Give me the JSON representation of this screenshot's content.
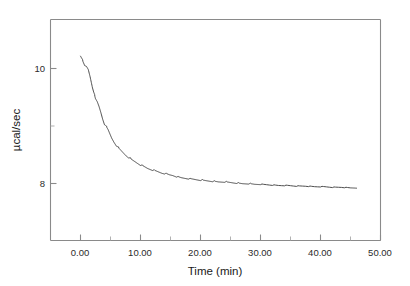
{
  "chart_data": {
    "type": "line",
    "title": "",
    "xlabel": "Time (min)",
    "ylabel": "µcal/sec",
    "xlim": [
      -5.0,
      50.0
    ],
    "ylim": [
      7.05,
      10.85
    ],
    "grid": false,
    "legend": null,
    "x_ticks": [
      0.0,
      10.0,
      20.0,
      30.0,
      40.0,
      50.0
    ],
    "x_tick_labels": [
      "0.00",
      "10.00",
      "20.00",
      "30.00",
      "40.00",
      "50.00"
    ],
    "x_minor_ticks": [
      5.0,
      15.0,
      25.0,
      35.0,
      45.0
    ],
    "y_ticks": [
      8.0,
      10.0
    ],
    "y_tick_labels": [
      "8",
      "10"
    ],
    "y_minor_ticks": [
      9.0
    ],
    "series": [
      {
        "name": "ITC raw thermogram",
        "color": "#3a3a3a",
        "x": [
          0.0,
          0.35,
          0.7,
          1.0,
          1.3,
          1.6,
          1.9,
          2.2,
          2.5,
          2.8,
          3.1,
          3.4,
          3.7,
          4.0,
          4.3,
          4.6,
          4.9,
          5.2,
          5.6,
          6.0,
          6.4,
          6.8,
          7.2,
          7.6,
          8.0,
          8.5,
          9.0,
          9.5,
          10.0,
          10.6,
          11.2,
          11.8,
          12.4,
          13.0,
          13.6,
          14.2,
          14.8,
          15.4,
          16.0,
          16.8,
          17.6,
          18.4,
          19.2,
          20.0,
          21.0,
          22.0,
          23.0,
          24.0,
          25.0,
          26.0,
          27.0,
          28.0,
          29.0,
          30.0,
          31.5,
          33.0,
          34.5,
          36.0,
          37.5,
          39.0,
          40.5,
          42.0,
          43.5,
          45.0,
          46.0
        ],
        "y": [
          10.22,
          10.12,
          10.04,
          10.03,
          9.98,
          9.86,
          9.72,
          9.58,
          9.47,
          9.42,
          9.34,
          9.24,
          9.13,
          9.04,
          8.99,
          8.94,
          8.87,
          8.8,
          8.73,
          8.67,
          8.62,
          8.58,
          8.54,
          8.5,
          8.47,
          8.43,
          8.4,
          8.37,
          8.34,
          8.31,
          8.28,
          8.26,
          8.24,
          8.22,
          8.2,
          8.19,
          8.17,
          8.16,
          8.14,
          8.12,
          8.11,
          8.1,
          8.09,
          8.08,
          8.07,
          8.06,
          8.05,
          8.05,
          8.04,
          8.03,
          8.02,
          8.02,
          8.01,
          8.01,
          8.0,
          7.99,
          7.99,
          7.98,
          7.98,
          7.97,
          7.97,
          7.96,
          7.96,
          7.95,
          7.95
        ]
      }
    ]
  }
}
